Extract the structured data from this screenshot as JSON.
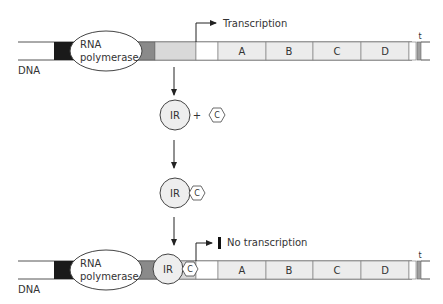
{
  "top_strand": {
    "dna_label": "DNA",
    "polymerase_label_line1": "RNA",
    "polymerase_label_line2": "polymerase",
    "transcription_label": "Transcription",
    "genes": [
      "A",
      "B",
      "C",
      "D"
    ],
    "terminator_label": "t"
  },
  "middle": {
    "repressor_label": "IR",
    "plus_sign": "+",
    "inducer_label": "C",
    "complex_repressor_label": "IR",
    "complex_inducer_label": "C"
  },
  "bottom_strand": {
    "dna_label": "DNA",
    "polymerase_label_line1": "RNA",
    "polymerase_label_line2": "polymerase",
    "bound_repressor_label": "IR",
    "bound_inducer_label": "C",
    "no_transcription_label": "No transcription",
    "genes": [
      "A",
      "B",
      "C",
      "D"
    ],
    "terminator_label": "t"
  },
  "colors": {
    "promoter_black": "#1a1a1a",
    "operator_dark_gray": "#8a8a8a",
    "regulator_light_gray": "#d9d9d9",
    "gene_fill": "#ececec",
    "protein_fill": "#eeeeee",
    "line": "#444444"
  }
}
